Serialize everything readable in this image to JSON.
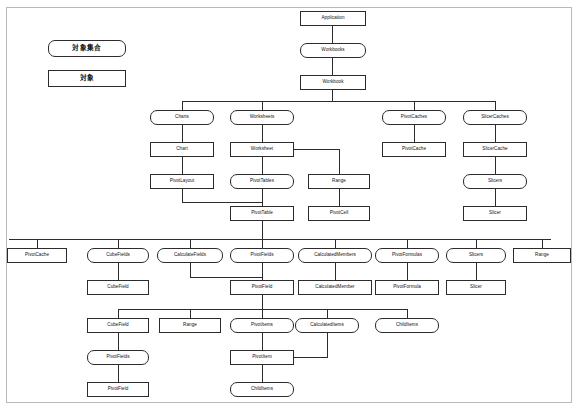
{
  "diagram": {
    "title_caption": "",
    "legend": {
      "collection_label": "対象集合",
      "object_label": "対象"
    },
    "nodes": {
      "application": "Application",
      "workbooks": "Workbooks",
      "workbook": "Workbook",
      "charts": "Charts",
      "chart": "Chart",
      "pivotlayout": "PivotLayout",
      "worksheets": "Worksheets",
      "worksheet": "Worksheet",
      "pivottables": "PivotTables",
      "pivottable": "PivotTable",
      "range_mid": "Range",
      "pivotcell": "PivotCell",
      "pivotcaches": "PivotCaches",
      "pivotcache_top": "PivotCache",
      "slicercaches": "SlicerCaches",
      "slicercache": "SlicerCache",
      "slicers_right": "Slicers",
      "slicer_right": "Slicer",
      "pivotcache_row": "PivotCache",
      "cubefields": "CubeFields",
      "cubefield_a": "CubeField",
      "calculatefields": "CalculateFields",
      "pivotfields_row": "PivotFields",
      "pivotfield_row": "PivotField",
      "calculatedmembers": "CalculatedMembers",
      "calculatedmember": "CalculatedMember",
      "pivotformulas": "PivotFormulas",
      "pivotformula": "PivotFormula",
      "slicers_row": "Slicers",
      "slicer_row": "Slicer",
      "range_row": "Range",
      "cubefield_b": "CubeField",
      "pivotfields_low": "PivotFields",
      "pivotfield_low": "PivotField",
      "range_low": "Range",
      "pivotitems": "PivotItems",
      "pivotitem": "PivotItem",
      "childitems_low": "ChildItems",
      "calculateditems": "CalculatedItems",
      "childitems_right": "ChildItems"
    },
    "colors": {
      "border": "#2c2c2c",
      "frame": "#b9b9b9",
      "background": "#ffffff",
      "text": "#101010"
    }
  }
}
